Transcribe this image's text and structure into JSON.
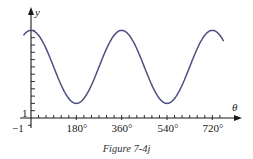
{
  "figure": {
    "caption": "Figure 7-4j"
  },
  "chart_data": {
    "type": "line",
    "title": "",
    "xlabel": "θ",
    "ylabel": "y",
    "x_tick_labels": [
      "−1",
      "180°",
      "360°",
      "540°",
      "720°"
    ],
    "y_tick_labels": [
      "1"
    ],
    "x_ticks_deg": [
      180,
      360,
      540,
      720
    ],
    "x_minor_tick_step_deg": 30,
    "y_minor_tick_step": 1,
    "xlim": [
      -30,
      770
    ],
    "ylim": [
      -1,
      13
    ],
    "grid": false,
    "legend": null,
    "series": [
      {
        "name": "y = 7 + 5cos θ",
        "color": "#4a4f80",
        "x": [
          -30,
          0,
          90,
          180,
          270,
          360,
          450,
          540,
          630,
          720,
          765
        ],
        "y": [
          11.3,
          12,
          7,
          2,
          7,
          12,
          7,
          2,
          7,
          12,
          10.5
        ]
      }
    ],
    "annotations": [
      "Figure 7-4j"
    ]
  },
  "colors": {
    "curve": "#4a4f80",
    "axis": "#1a1a1a"
  }
}
